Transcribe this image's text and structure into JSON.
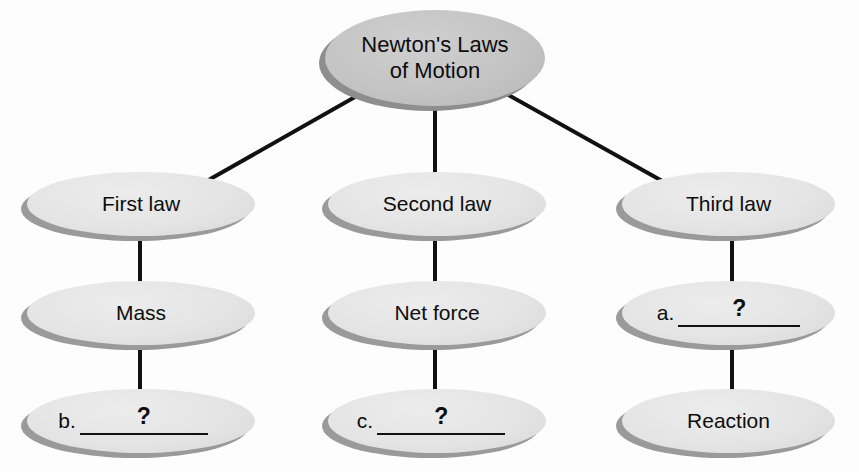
{
  "diagram": {
    "type": "concept-map",
    "title": "Newton's Laws of Motion",
    "orientation": "top-down tree",
    "node_shape": "ellipse",
    "colors": {
      "background": "#fdfdfd",
      "root_fill": "#c4c4c4",
      "node_fill": "#e4e4e4",
      "shadow": "#9a9a9a",
      "connector": "#111111",
      "text": "#0d0d0d"
    },
    "nodes": [
      {
        "id": "root",
        "label": "Newton's Laws\nof Motion",
        "level": 0,
        "kind": "filled",
        "font_size": 22
      },
      {
        "id": "first-law",
        "label": "First law",
        "level": 1,
        "kind": "filled",
        "font_size": 21
      },
      {
        "id": "second-law",
        "label": "Second law",
        "level": 1,
        "kind": "filled",
        "font_size": 21
      },
      {
        "id": "third-law",
        "label": "Third law",
        "level": 1,
        "kind": "filled",
        "font_size": 21
      },
      {
        "id": "mass",
        "label": "Mass",
        "level": 2,
        "kind": "filled",
        "font_size": 21
      },
      {
        "id": "net-force",
        "label": "Net force",
        "level": 2,
        "kind": "filled",
        "font_size": 21
      },
      {
        "id": "blank-a",
        "label": "",
        "level": 2,
        "kind": "blank",
        "letter": "a.",
        "question_mark": "?"
      },
      {
        "id": "blank-b",
        "label": "",
        "level": 3,
        "kind": "blank",
        "letter": "b.",
        "question_mark": "?"
      },
      {
        "id": "blank-c",
        "label": "",
        "level": 3,
        "kind": "blank",
        "letter": "c.",
        "question_mark": "?"
      },
      {
        "id": "reaction",
        "label": "Reaction",
        "level": 3,
        "kind": "filled",
        "font_size": 21
      }
    ],
    "edges": [
      {
        "from": "root",
        "to": "first-law",
        "style": "diagonal"
      },
      {
        "from": "root",
        "to": "second-law",
        "style": "vertical"
      },
      {
        "from": "root",
        "to": "third-law",
        "style": "diagonal"
      },
      {
        "from": "first-law",
        "to": "mass",
        "style": "vertical"
      },
      {
        "from": "second-law",
        "to": "net-force",
        "style": "vertical"
      },
      {
        "from": "third-law",
        "to": "blank-a",
        "style": "vertical"
      },
      {
        "from": "mass",
        "to": "blank-b",
        "style": "vertical"
      },
      {
        "from": "net-force",
        "to": "blank-c",
        "style": "vertical"
      },
      {
        "from": "blank-a",
        "to": "reaction",
        "style": "vertical"
      }
    ]
  }
}
